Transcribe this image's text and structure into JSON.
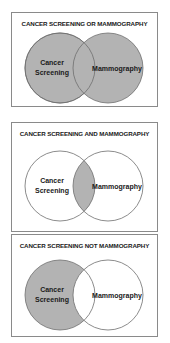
{
  "colors": {
    "shade": "#b3b3b3",
    "stroke": "#6e6e6e",
    "background": "#ffffff",
    "border": "#8a8a8a"
  },
  "panels": [
    {
      "title": "CANCER SCREENING OR MAMMOGRAPHY",
      "operator": "OR",
      "left_label_line1": "Cancer",
      "left_label_line2": "Screening",
      "right_label": "Mammography",
      "shaded": "union"
    },
    {
      "title": "CANCER SCREENING AND MAMMOGRAPHY",
      "operator": "AND",
      "left_label_line1": "Cancer",
      "left_label_line2": "Screening",
      "right_label": "Mammography",
      "shaded": "intersection"
    },
    {
      "title": "CANCER SCREENING NOT MAMMOGRAPHY",
      "operator": "NOT",
      "left_label_line1": "Cancer",
      "left_label_line2": "Screening",
      "right_label": "Mammography",
      "shaded": "left-only"
    }
  ]
}
